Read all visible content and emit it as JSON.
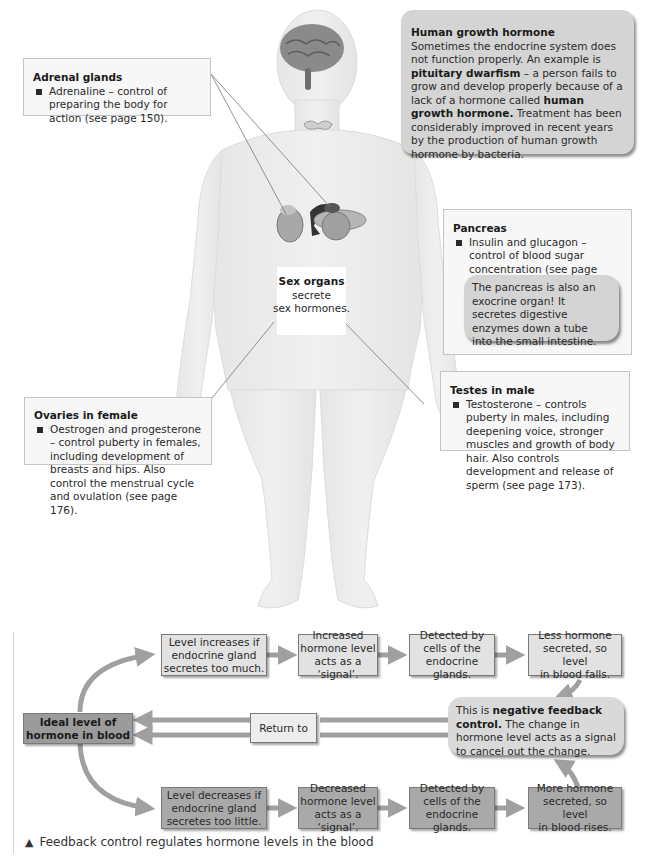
{
  "body_figure": {
    "sex_organs_label": {
      "title": "Sex organs",
      "line1": "secrete",
      "line2": "sex hormones."
    }
  },
  "adrenal_box": {
    "title": "Adrenal glands",
    "bullet": "Adrenaline – control of preparing the body for action (see page 150)."
  },
  "hgh_box": {
    "title": "Human growth hormone",
    "text_1": "Sometimes the endocrine system does not function properly. An example is ",
    "bold_1": "pituitary dwarfism",
    "text_2": " – a person fails to grow and develop properly because of a lack of a hormone called ",
    "bold_2": "human growth hormone.",
    "text_3": " Treatment has been considerably improved in recent years by the production of human growth hormone by bacteria."
  },
  "pancreas_box": {
    "title": "Pancreas",
    "bullet": "Insulin and glucagon – control of blood sugar concentration (see page 132).",
    "note": "The pancreas is also an exocrine organ! It secretes digestive enzymes down a tube into the small intestine."
  },
  "ovaries_box": {
    "title": "Ovaries in female",
    "bullet": "Oestrogen and progesterone – control puberty in females, including development of breasts and hips. Also control the menstrual cycle and ovulation (see page 176)."
  },
  "testes_box": {
    "title": "Testes in male",
    "bullet": "Testosterone – controls puberty in males, including deepening voice, stronger muscles and growth of body hair. Also controls development and release of sperm (see page 173)."
  },
  "feedback": {
    "ideal": "Ideal level of\nhormone in blood",
    "return_to": "Return to",
    "top_row": [
      "Level increases if\nendocrine gland\nsecretes too much.",
      "Increased\nhormone level\nacts as a ‘signal’.",
      "Detected by\ncells of the\nendocrine glands.",
      "Less hormone\nsecreted, so level\nin blood falls."
    ],
    "bottom_row": [
      "Level decreases if\nendocrine gland\nsecretes too little.",
      "Decreased\nhormone level\nacts as a ‘signal’.",
      "Detected by\ncells of the\nendocrine glands.",
      "More hormone\nsecreted, so level\nin blood rises."
    ],
    "negative_feedback": {
      "prefix": "This is ",
      "bold": "negative feedback control.",
      "rest": " The change in hormone level acts as a signal to cancel out the change."
    }
  },
  "caption": {
    "marker": "▲",
    "text": "Feedback control regulates hormone levels in the blood"
  },
  "colors": {
    "box_fill": "#f7f7f7",
    "bubble_fill": "#d4d4d4",
    "flow_light": "#e2e2e2",
    "flow_dark": "#a9a9a9",
    "arrow": "#a0a0a0",
    "body": "#ececec"
  }
}
